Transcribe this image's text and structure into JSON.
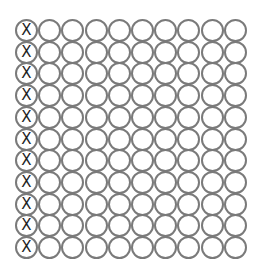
{
  "grid": {
    "rows": 11,
    "cols": 10,
    "marked_column": 0,
    "mark_symbol": "X",
    "circle_color": "#7a7a7a",
    "mark_color": "#1e1e1e"
  }
}
